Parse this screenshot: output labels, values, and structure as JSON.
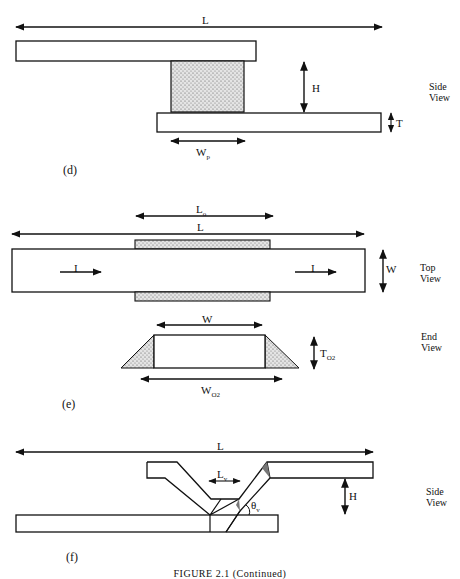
{
  "panels": {
    "d": {
      "label": "(d)",
      "view": [
        "Side",
        "View"
      ],
      "dims": {
        "L": "L",
        "H": "H",
        "T": "T",
        "Wp_main": "W",
        "Wp_sub": "p"
      }
    },
    "e": {
      "label": "(e)",
      "top_view": [
        "Top",
        "View"
      ],
      "end_view": [
        "End",
        "View"
      ],
      "dims": {
        "Lo_main": "L",
        "Lo_sub": "o",
        "L": "L",
        "W_side": "W",
        "W_end": "W",
        "I_left": "I",
        "I_right": "I",
        "To2_main": "T",
        "To2_sub": "O2",
        "Wo2_main": "W",
        "Wo2_sub": "O2"
      }
    },
    "f": {
      "label": "(f)",
      "view": [
        "Side",
        "View"
      ],
      "dims": {
        "L": "L",
        "Lv_main": "L",
        "Lv_sub": "v",
        "H": "H",
        "theta_main": "θ",
        "theta_sub": "v"
      }
    }
  },
  "caption": "FIGURE 2.1 (Continued)"
}
